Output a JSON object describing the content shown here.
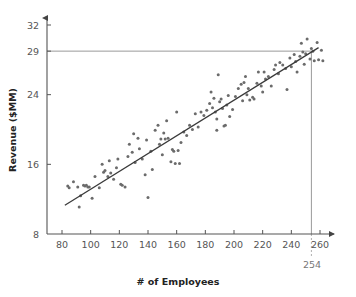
{
  "chart_data": {
    "type": "scatter",
    "title": "",
    "xlabel": "# of Employees",
    "ylabel": "Revenue ($MM)",
    "xlim": [
      70,
      268
    ],
    "ylim": [
      8,
      33
    ],
    "grid": false,
    "legend": null,
    "x_ticks": [
      80,
      100,
      120,
      140,
      160,
      180,
      200,
      220,
      240,
      260
    ],
    "y_ticks": [
      8,
      16,
      24,
      29,
      32
    ],
    "x_tick_labels": [
      "80",
      "100",
      "120",
      "140",
      "160",
      "180",
      "200",
      "220",
      "240",
      "260"
    ],
    "y_tick_labels": [
      "8",
      "16",
      "24",
      "29",
      "32"
    ],
    "annotations": [
      {
        "name": "x-reference-254",
        "label": "254",
        "axis": "x",
        "value": 254
      },
      {
        "name": "y-reference-29",
        "label": "29",
        "axis": "y",
        "value": 29
      }
    ],
    "trend_line": {
      "name": "regression-line",
      "x_start": 82,
      "y_start": 11.3,
      "x_end": 259,
      "y_end": 29.4
    },
    "series": [
      {
        "name": "revenue-vs-employees",
        "color": "#6b6b6b",
        "points": [
          [
            84,
            13.5
          ],
          [
            85,
            13.3
          ],
          [
            88,
            14.0
          ],
          [
            91,
            13.4
          ],
          [
            92,
            11.1
          ],
          [
            93,
            12.4
          ],
          [
            95,
            13.6
          ],
          [
            96,
            13.5
          ],
          [
            97,
            13.6
          ],
          [
            98,
            13.4
          ],
          [
            99,
            13.4
          ],
          [
            101,
            12.1
          ],
          [
            103,
            14.6
          ],
          [
            106,
            13.3
          ],
          [
            108,
            16.0
          ],
          [
            109,
            15.1
          ],
          [
            110,
            15.3
          ],
          [
            112,
            14.6
          ],
          [
            113,
            16.4
          ],
          [
            114,
            15.0
          ],
          [
            116,
            14.3
          ],
          [
            118,
            15.6
          ],
          [
            119,
            16.6
          ],
          [
            121,
            13.7
          ],
          [
            122,
            13.6
          ],
          [
            124,
            13.4
          ],
          [
            126,
            16.9
          ],
          [
            127,
            18.3
          ],
          [
            129,
            17.4
          ],
          [
            130,
            19.5
          ],
          [
            131,
            16.2
          ],
          [
            133,
            19.0
          ],
          [
            134,
            17.8
          ],
          [
            136,
            16.6
          ],
          [
            138,
            14.8
          ],
          [
            139,
            18.8
          ],
          [
            140,
            12.2
          ],
          [
            142,
            17.5
          ],
          [
            143,
            15.4
          ],
          [
            145,
            19.9
          ],
          [
            147,
            20.5
          ],
          [
            148,
            18.3
          ],
          [
            149,
            18.9
          ],
          [
            150,
            17.1
          ],
          [
            151,
            19.6
          ],
          [
            152,
            18.9
          ],
          [
            153,
            21.0
          ],
          [
            154,
            19.0
          ],
          [
            156,
            16.3
          ],
          [
            157,
            17.7
          ],
          [
            158,
            17.5
          ],
          [
            159,
            16.1
          ],
          [
            160,
            22.0
          ],
          [
            161,
            17.6
          ],
          [
            162,
            16.1
          ],
          [
            163,
            18.5
          ],
          [
            165,
            19.7
          ],
          [
            167,
            19.3
          ],
          [
            169,
            20.5
          ],
          [
            171,
            20.0
          ],
          [
            173,
            21.8
          ],
          [
            175,
            20.3
          ],
          [
            177,
            22.0
          ],
          [
            179,
            21.6
          ],
          [
            181,
            22.2
          ],
          [
            183,
            23.0
          ],
          [
            184,
            24.3
          ],
          [
            185,
            22.5
          ],
          [
            186,
            23.6
          ],
          [
            187,
            22.0
          ],
          [
            188,
            21.2
          ],
          [
            188,
            19.9
          ],
          [
            189,
            26.3
          ],
          [
            190,
            23.2
          ],
          [
            191,
            23.5
          ],
          [
            192,
            22.4
          ],
          [
            193,
            20.4
          ],
          [
            194,
            20.5
          ],
          [
            195,
            22.8
          ],
          [
            196,
            23.9
          ],
          [
            197,
            21.5
          ],
          [
            199,
            22.3
          ],
          [
            201,
            23.8
          ],
          [
            203,
            24.7
          ],
          [
            205,
            25.2
          ],
          [
            206,
            23.3
          ],
          [
            207,
            25.4
          ],
          [
            208,
            26.1
          ],
          [
            209,
            24.0
          ],
          [
            210,
            24.7
          ],
          [
            211,
            23.4
          ],
          [
            213,
            23.7
          ],
          [
            214,
            23.5
          ],
          [
            216,
            25.3
          ],
          [
            217,
            26.6
          ],
          [
            219,
            25.0
          ],
          [
            220,
            24.3
          ],
          [
            221,
            26.6
          ],
          [
            222,
            25.8
          ],
          [
            224,
            26.1
          ],
          [
            226,
            25.0
          ],
          [
            228,
            26.9
          ],
          [
            229,
            27.4
          ],
          [
            231,
            26.4
          ],
          [
            232,
            27.7
          ],
          [
            234,
            27.4
          ],
          [
            236,
            27.0
          ],
          [
            237,
            24.6
          ],
          [
            239,
            28.2
          ],
          [
            240,
            27.2
          ],
          [
            242,
            28.6
          ],
          [
            243,
            27.8
          ],
          [
            244,
            26.6
          ],
          [
            246,
            28.4
          ],
          [
            247,
            29.9
          ],
          [
            248,
            28.9
          ],
          [
            249,
            27.5
          ],
          [
            250,
            28.7
          ],
          [
            251,
            30.4
          ],
          [
            253,
            28.1
          ],
          [
            254,
            29.3
          ],
          [
            255,
            29.0
          ],
          [
            256,
            27.9
          ],
          [
            258,
            30.0
          ],
          [
            259,
            28.0
          ],
          [
            261,
            29.1
          ],
          [
            262,
            27.9
          ]
        ]
      }
    ]
  },
  "icons": {
    "x_axis_arrow": "arrow-right-icon",
    "y_axis_arrow": "arrow-up-icon"
  }
}
